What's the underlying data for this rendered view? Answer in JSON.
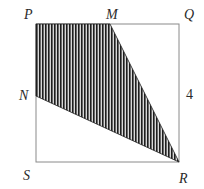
{
  "figure": {
    "type": "geometry-square-with-shaded-quadrilateral",
    "square": {
      "vertices": [
        "P",
        "Q",
        "R",
        "S"
      ],
      "side_label": "4",
      "side_label_on": "QR"
    },
    "shaded_region": {
      "vertices": [
        "P",
        "M",
        "R",
        "N"
      ],
      "pattern": "vertical-hatch"
    },
    "points": {
      "P": {
        "label": "P",
        "x": 36,
        "y": 24
      },
      "M": {
        "label": "M",
        "x": 110,
        "y": 24
      },
      "Q": {
        "label": "Q",
        "x": 179,
        "y": 24
      },
      "N": {
        "label": "N",
        "x": 36,
        "y": 96
      },
      "S": {
        "label": "S",
        "x": 36,
        "y": 162
      },
      "R": {
        "label": "R",
        "x": 179,
        "y": 162
      }
    },
    "labels": {
      "P": "P",
      "M": "M",
      "Q": "Q",
      "N": "N",
      "S": "S",
      "R": "R",
      "side": "4"
    },
    "colors": {
      "outline": "#8a8a8a",
      "hatch_dark": "#1e1e1e",
      "hatch_light": "#d8d8d8",
      "text": "#2a2a2a"
    }
  }
}
